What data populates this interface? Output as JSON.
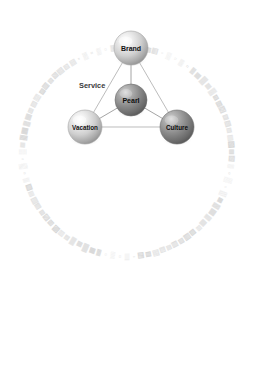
{
  "canvas": {
    "width": 259,
    "height": 377,
    "background_color": "#ffffff"
  },
  "diagram": {
    "type": "node-link-sphere-diagram",
    "title_visible": false,
    "nodes": [
      {
        "id": "brand",
        "label": "Brand",
        "cx": 131,
        "cy": 48,
        "r": 17,
        "shade": "light",
        "base_color": "#b9b9b9",
        "highlight_color": "#f2f2f2"
      },
      {
        "id": "pearl",
        "label": "Pearl",
        "cx": 131,
        "cy": 100,
        "r": 16,
        "shade": "dark",
        "base_color": "#808080",
        "highlight_color": "#cfcfcf"
      },
      {
        "id": "vacation",
        "label": "Vacation",
        "cx": 85,
        "cy": 127,
        "r": 17,
        "shade": "light",
        "base_color": "#c2c2c2",
        "highlight_color": "#f5f5f5"
      },
      {
        "id": "culture",
        "label": "Culture",
        "cx": 177,
        "cy": 127,
        "r": 17,
        "shade": "dark",
        "base_color": "#7d7d7d",
        "highlight_color": "#c9c9c9"
      }
    ],
    "edges": [
      {
        "id": "edge-brand-vacation",
        "from": "brand",
        "to": "vacation"
      },
      {
        "id": "edge-brand-culture",
        "from": "brand",
        "to": "culture"
      },
      {
        "id": "edge-vacation-culture",
        "from": "vacation",
        "to": "culture"
      },
      {
        "id": "edge-pearl-brand",
        "from": "pearl",
        "to": "brand"
      },
      {
        "id": "edge-pearl-vacation",
        "from": "pearl",
        "to": "vacation"
      },
      {
        "id": "edge-pearl-culture",
        "from": "pearl",
        "to": "culture"
      }
    ],
    "annotations": [
      {
        "id": "service-label",
        "text": "Service",
        "x": 79,
        "y": 88
      }
    ],
    "ring": {
      "id": "decorative-text-ring",
      "cx": 127,
      "cy": 152,
      "radius": 105,
      "color": "#d2d2d2",
      "glyph_count": 92,
      "glyph": "▤",
      "legible": false
    }
  }
}
